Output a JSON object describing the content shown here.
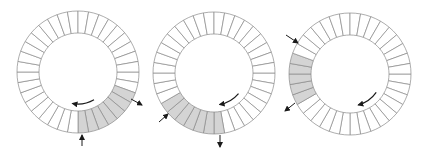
{
  "diagram": {
    "title": "",
    "colors": {
      "background": "#ffffff",
      "stroke": "#8a8a8a",
      "shaded": "#d4d4d4",
      "arrow": "#1a1a1a"
    },
    "segments_per_ring": 36,
    "outer_radius": 61,
    "inner_radius": 39,
    "rings": [
      {
        "id": "ring-1",
        "center": [
          78,
          72
        ],
        "shaded_start_deg": 20,
        "shaded_end_deg": 90,
        "arrows": [
          {
            "role": "inflow",
            "from": [
              82,
              146
            ],
            "to": [
              82,
              135
            ]
          },
          {
            "role": "outflow",
            "from": [
              131,
              99
            ],
            "to": [
              142,
              105
            ]
          }
        ],
        "rotation_arrow": {
          "from_deg": 60,
          "to_deg": 100,
          "radius": 32,
          "direction": "clockwise"
        }
      },
      {
        "id": "ring-2",
        "center": [
          214,
          73
        ],
        "shaded_start_deg": 85,
        "shaded_end_deg": 145,
        "arrows": [
          {
            "role": "inflow",
            "from": [
              159,
              122
            ],
            "to": [
              168,
              114
            ]
          },
          {
            "role": "outflow",
            "from": [
              220,
              135
            ],
            "to": [
              220,
              147
            ]
          }
        ],
        "rotation_arrow": {
          "from_deg": 40,
          "to_deg": 80,
          "radius": 32,
          "direction": "clockwise"
        }
      },
      {
        "id": "ring-3",
        "center": [
          350,
          74
        ],
        "shaded_start_deg": 150,
        "shaded_end_deg": 200,
        "arrows": [
          {
            "role": "inflow",
            "from": [
              286,
              35
            ],
            "to": [
              298,
              43
            ]
          },
          {
            "role": "outflow",
            "from": [
              295,
              103
            ],
            "to": [
              285,
              111
            ]
          }
        ],
        "rotation_arrow": {
          "from_deg": 35,
          "to_deg": 75,
          "radius": 32,
          "direction": "clockwise"
        }
      }
    ]
  }
}
